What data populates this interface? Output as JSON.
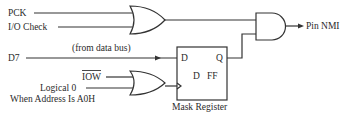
{
  "diagram": {
    "inputs": {
      "pck": "PCK",
      "io_check": "I/O Check",
      "d7": "D7",
      "d7_note": "(from data bus)",
      "iow": "IOW",
      "logical0_line1": "Logical 0",
      "logical0_line2": "When Address Is A0H"
    },
    "output": {
      "label": "Pin NMI"
    },
    "flip_flop": {
      "d_pin": "D",
      "q_pin": "Q",
      "type_d": "D",
      "type_ff": "FF",
      "name": "Mask Register"
    },
    "gates": [
      {
        "id": "or-1",
        "type": "OR",
        "inputs": [
          "PCK",
          "I/O Check"
        ]
      },
      {
        "id": "or-2",
        "type": "OR",
        "inputs": [
          "IOW",
          "Logical 0 When Address Is A0H"
        ],
        "output_to": "Mask Register clock"
      },
      {
        "id": "and-1",
        "type": "AND",
        "inputs": [
          "or-1",
          "Mask Register Q"
        ],
        "output_to": "Pin NMI"
      }
    ],
    "colors": {
      "line": "#333333",
      "background": "#ffffff",
      "text": "#2a2a2a"
    }
  }
}
